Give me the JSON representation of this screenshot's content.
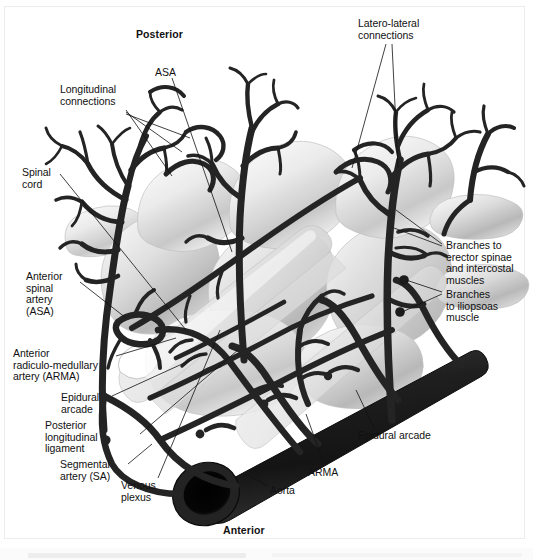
{
  "figure": {
    "title_orientation_top": "Posterior",
    "title_orientation_bottom": "Anterior"
  },
  "colors": {
    "background": "#ffffff",
    "vessel_dark": "#262626",
    "vessel_outline": "#111111",
    "bone_light": "#e8e8e8",
    "bone_mid": "#c9c9c9",
    "bone_shadow": "#a3a3a3",
    "leader_line": "#1a1a1a",
    "text": "#111111",
    "frame": "#ececec"
  },
  "labels": [
    {
      "id": "posterior",
      "text": "Posterior",
      "x": 136,
      "y": 29,
      "bold": true,
      "align": "left"
    },
    {
      "id": "anterior",
      "text": "Anterior",
      "x": 223,
      "y": 525,
      "bold": true,
      "align": "left"
    },
    {
      "id": "asa-top",
      "text": "ASA",
      "x": 155,
      "y": 67,
      "bold": false,
      "align": "left"
    },
    {
      "id": "latero-lateral",
      "text": "Latero-lateral\nconnections",
      "x": 358,
      "y": 18,
      "bold": false,
      "align": "left"
    },
    {
      "id": "longitudinal",
      "text": "Longitudinal\nconnections",
      "x": 60,
      "y": 84,
      "bold": false,
      "align": "left"
    },
    {
      "id": "spinal-cord",
      "text": "Spinal\ncord",
      "x": 22,
      "y": 167,
      "bold": false,
      "align": "left"
    },
    {
      "id": "anterior-spinal-artery",
      "text": "Anterior\nspinal\nartery\n(ASA)",
      "x": 26,
      "y": 271,
      "bold": false,
      "align": "left"
    },
    {
      "id": "arma-left",
      "text": "Anterior\nradiculo-medullary\nartery (ARMA)",
      "x": 13,
      "y": 348,
      "bold": false,
      "align": "left"
    },
    {
      "id": "epidural-arcade-left",
      "text": "Epidural\narcade",
      "x": 61,
      "y": 392,
      "bold": false,
      "align": "left"
    },
    {
      "id": "posterior-longitudinal-ligament",
      "text": "Posterior\nlongitudinal\nligament",
      "x": 45,
      "y": 420,
      "bold": false,
      "align": "left"
    },
    {
      "id": "segmental-artery",
      "text": "Segmental\nartery (SA)",
      "x": 60,
      "y": 459,
      "bold": false,
      "align": "left"
    },
    {
      "id": "venous-plexus",
      "text": "Venous\nplexus",
      "x": 121,
      "y": 480,
      "bold": false,
      "align": "left"
    },
    {
      "id": "aorta",
      "text": "Aorta",
      "x": 270,
      "y": 485,
      "bold": false,
      "align": "left"
    },
    {
      "id": "arma-bottom",
      "text": "ARMA",
      "x": 308,
      "y": 467,
      "bold": false,
      "align": "left"
    },
    {
      "id": "epidural-arcade-right",
      "text": "Epidural arcade",
      "x": 358,
      "y": 430,
      "bold": false,
      "align": "left"
    },
    {
      "id": "branches-erector-spinae",
      "text": "Branches to\nerector spinae\nand intercostal\nmuscles",
      "x": 446,
      "y": 240,
      "bold": false,
      "align": "left"
    },
    {
      "id": "branches-iliopsoas",
      "text": "Branches\nto iliopsoas\nmuscle",
      "x": 446,
      "y": 289,
      "bold": false,
      "align": "left"
    }
  ],
  "structures": [
    {
      "id": "aorta",
      "name": "Aorta",
      "type": "vessel",
      "note": "thick dark tube, lower right diagonal, open lumen at lower-left end"
    },
    {
      "id": "segmental-artery",
      "name": "Segmental artery (SA)",
      "type": "vessel",
      "note": "arises from aorta, encircles vertebral body"
    },
    {
      "id": "arma",
      "name": "Anterior radiculo-medullary artery (ARMA)",
      "type": "vessel",
      "note": "ascends to join ASA"
    },
    {
      "id": "asa",
      "name": "Anterior spinal artery (ASA)",
      "type": "vessel",
      "note": "longitudinal midline anterior vessel"
    },
    {
      "id": "epidural-arcade",
      "name": "Epidural arcade",
      "type": "vessel",
      "note": "transverse anastomotic arcade in epidural space"
    },
    {
      "id": "longitudinal-connections",
      "name": "Longitudinal connections",
      "type": "vessel",
      "note": "cranio-caudal anastomoses on posterior surface"
    },
    {
      "id": "latero-lateral-connections",
      "name": "Latero-lateral connections",
      "type": "vessel",
      "note": "side-to-side anastomoses across midline"
    },
    {
      "id": "venous-plexus",
      "name": "Venous plexus",
      "type": "vessel",
      "note": "epidural venous network"
    },
    {
      "id": "branches-erector-spinae",
      "name": "Branches to erector spinae and intercostal muscles",
      "type": "vessel",
      "note": "posterior muscular branches"
    },
    {
      "id": "branches-iliopsoas",
      "name": "Branches to iliopsoas muscle",
      "type": "vessel",
      "note": "anterior muscular branches"
    },
    {
      "id": "spinal-cord",
      "name": "Spinal cord",
      "type": "neural",
      "note": "translucent cord within canal"
    },
    {
      "id": "vertebral-bodies",
      "name": "Vertebral bodies",
      "type": "bone",
      "note": "three translucent grey vertebrae in oblique view"
    },
    {
      "id": "posterior-longitudinal-ligament",
      "name": "Posterior longitudinal ligament",
      "type": "ligament",
      "note": "band on posterior vertebral body surface"
    }
  ]
}
